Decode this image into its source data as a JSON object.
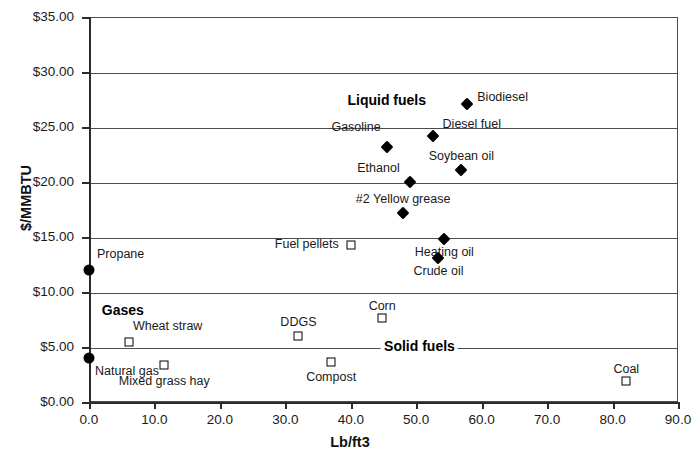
{
  "chart_data": {
    "type": "scatter",
    "title": "",
    "xlabel": "Lb/ft3",
    "ylabel": "$/MMBTU",
    "xlim": [
      0.0,
      90.0
    ],
    "ylim": [
      0.0,
      35.0
    ],
    "grid": "horizontal",
    "legend": "none",
    "x_ticks": [
      "0.0",
      "10.0",
      "20.0",
      "30.0",
      "40.0",
      "50.0",
      "60.0",
      "70.0",
      "80.0",
      "90.0"
    ],
    "x_tick_values": [
      0,
      10,
      20,
      30,
      40,
      50,
      60,
      70,
      80,
      90
    ],
    "y_ticks": [
      "$0.00",
      "$5.00",
      "$10.00",
      "$15.00",
      "$20.00",
      "$25.00",
      "$30.00",
      "$35.00"
    ],
    "y_tick_values": [
      0,
      5,
      10,
      15,
      20,
      25,
      30,
      35
    ],
    "series": [
      {
        "name": "Liquid fuels",
        "marker": "diamond",
        "points": [
          {
            "label": "Biodiesel",
            "x": 57.8,
            "y": 27.1,
            "label_dx": 10,
            "label_dy": -13,
            "anchor": "start"
          },
          {
            "label": "Diesel fuel",
            "x": 52.5,
            "y": 24.2,
            "label_dx": 10,
            "label_dy": -18,
            "anchor": "start"
          },
          {
            "label": "Gasoline",
            "x": 45.5,
            "y": 23.2,
            "label_dx": -6,
            "label_dy": -26,
            "anchor": "end"
          },
          {
            "label": "Soybean oil",
            "x": 56.9,
            "y": 21.1,
            "label_dx": 0,
            "label_dy": -20,
            "anchor": "mid"
          },
          {
            "label": "Ethanol",
            "x": 49.0,
            "y": 20.0,
            "label_dx": -10,
            "label_dy": -20,
            "anchor": "end"
          },
          {
            "label": "#2 Yellow grease",
            "x": 48.0,
            "y": 17.2,
            "label_dx": 0,
            "label_dy": -20,
            "anchor": "mid"
          },
          {
            "label": "Heating oil",
            "x": 54.3,
            "y": 14.8,
            "label_dx": 0,
            "label_dy": 7,
            "anchor": "mid"
          },
          {
            "label": "Crude oil",
            "x": 53.4,
            "y": 13.1,
            "label_dx": 0,
            "label_dy": 7,
            "anchor": "mid"
          }
        ]
      },
      {
        "name": "Gases",
        "marker": "circle",
        "points": [
          {
            "label": "Propane",
            "x": 0.0,
            "y": 12.0,
            "label_dx": 8,
            "label_dy": -22,
            "anchor": "start"
          },
          {
            "label": "Natural gas",
            "x": 0.0,
            "y": 4.0,
            "label_dx": 6,
            "label_dy": 7,
            "anchor": "start"
          }
        ]
      },
      {
        "name": "Solid fuels",
        "marker": "square",
        "points": [
          {
            "label": "Fuel pellets",
            "x": 40.0,
            "y": 14.3,
            "label_dx": -12,
            "label_dy": -7,
            "anchor": "end"
          },
          {
            "label": "Corn",
            "x": 44.8,
            "y": 7.6,
            "label_dx": 0,
            "label_dy": -18,
            "anchor": "mid"
          },
          {
            "label": "DDGS",
            "x": 32.0,
            "y": 6.0,
            "label_dx": 0,
            "label_dy": -20,
            "anchor": "mid"
          },
          {
            "label": "Wheat straw",
            "x": 6.1,
            "y": 5.5,
            "label_dx": 4,
            "label_dy": -22,
            "anchor": "start"
          },
          {
            "label": "Compost",
            "x": 37.0,
            "y": 3.6,
            "label_dx": 0,
            "label_dy": 9,
            "anchor": "mid"
          },
          {
            "label": "Mixed grass hay",
            "x": 11.5,
            "y": 3.4,
            "label_dx": 0,
            "label_dy": 10,
            "anchor": "mid"
          },
          {
            "label": "Coal",
            "x": 82.1,
            "y": 1.9,
            "label_dx": 0,
            "label_dy": -18,
            "anchor": "mid"
          }
        ]
      }
    ],
    "annotations": [
      {
        "text": "Liquid fuels",
        "x": 45.5,
        "y": 27.4,
        "anchor": "mid"
      },
      {
        "text": "Gases",
        "x": 1.5,
        "y": 8.3,
        "anchor": "start"
      },
      {
        "text": "Solid fuels",
        "x": 50.5,
        "y": 5.0,
        "anchor": "mid"
      }
    ]
  }
}
